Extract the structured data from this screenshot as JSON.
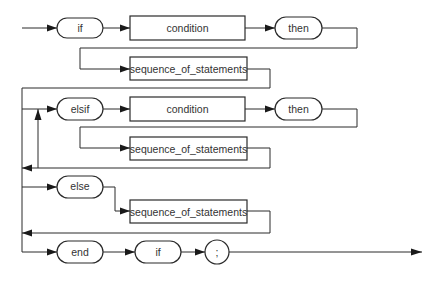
{
  "diagram": {
    "type": "syntax-railroad-diagram",
    "colors": {
      "line": "#2a2a2a",
      "background": "#ffffff",
      "text": "#333333"
    },
    "rows": [
      {
        "name": "if-clause",
        "terminals": [
          "if",
          "then"
        ],
        "nonterminals": [
          "condition",
          "sequence_of_statements"
        ],
        "labels": {
          "keyword_if": "if",
          "condition": "condition",
          "keyword_then": "then",
          "sequence": "sequence_of_statements"
        }
      },
      {
        "name": "elsif-clause",
        "repeatable": true,
        "optional": true,
        "labels": {
          "keyword_elsif": "elsif",
          "condition": "condition",
          "keyword_then": "then",
          "sequence": "sequence_of_statements"
        }
      },
      {
        "name": "else-clause",
        "optional": true,
        "labels": {
          "keyword_else": "else",
          "sequence": "sequence_of_statements"
        }
      },
      {
        "name": "end-clause",
        "labels": {
          "keyword_end": "end",
          "keyword_if": "if",
          "semicolon": ";"
        }
      }
    ]
  }
}
